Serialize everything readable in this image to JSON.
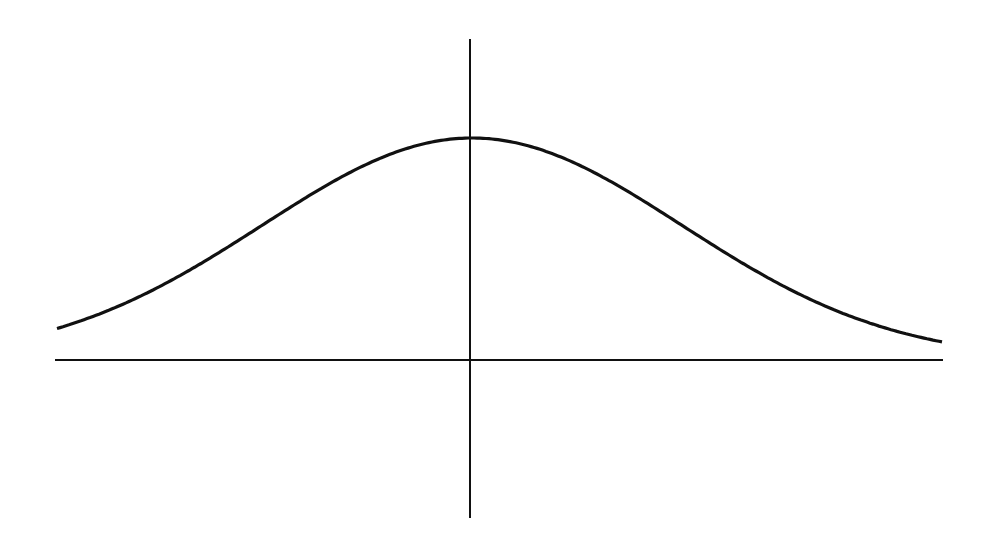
{
  "diagram": {
    "type": "normal-curve",
    "colors": {
      "background": "#ffffff",
      "stroke": "#111111"
    },
    "x_axis": {
      "x1": 55,
      "x2": 943,
      "y": 360
    },
    "y_axis": {
      "x": 470,
      "y1": 39,
      "y2": 518
    },
    "curve": {
      "center_x": 472,
      "baseline_y": 360,
      "peak_y": 138,
      "sigma_px": 210,
      "x_start": 57,
      "x_end": 942
    }
  }
}
